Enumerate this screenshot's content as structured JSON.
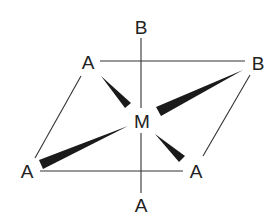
{
  "diagram": {
    "center": {
      "label": "M",
      "x": 141,
      "y": 128
    },
    "ligands": [
      {
        "id": "top",
        "label": "B",
        "x": 141,
        "y": 33
      },
      {
        "id": "upper-left",
        "label": "A",
        "x": 88,
        "y": 69
      },
      {
        "id": "upper-right",
        "label": "B",
        "x": 258,
        "y": 70
      },
      {
        "id": "lower-left",
        "label": "A",
        "x": 28,
        "y": 178
      },
      {
        "id": "lower-right",
        "label": "A",
        "x": 196,
        "y": 178
      },
      {
        "id": "bottom",
        "label": "A",
        "x": 141,
        "y": 212
      }
    ],
    "colors": {
      "line": "#333333",
      "wedge": "#1a1a1a",
      "text": "#222222",
      "background": "#ffffff"
    }
  }
}
